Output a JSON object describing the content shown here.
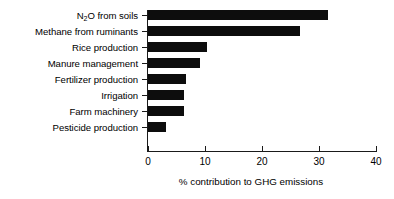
{
  "chart_data": {
    "type": "bar",
    "orientation": "horizontal",
    "title": "",
    "xlabel": "% contribution to GHG emissions",
    "ylabel": "",
    "xlim": [
      0,
      40
    ],
    "xticks": [
      0,
      10,
      20,
      30,
      40
    ],
    "xtick_labels": [
      "0",
      "10",
      "20",
      "30",
      "40"
    ],
    "grid": false,
    "legend": false,
    "bar_color": "#0d0d0d",
    "axis_color": "#1a1a1a",
    "background": "#ffffff",
    "categories": [
      "N₂O from soils",
      "Methane from ruminants",
      "Rice production",
      "Manure management",
      "Fertilizer production",
      "Irrigation",
      "Farm machinery",
      "Pesticide production"
    ],
    "category_parts": [
      {
        "pre": "N",
        "sub": "2",
        "post": "O from soils"
      },
      {
        "pre": "Methane from ruminants",
        "sub": "",
        "post": ""
      },
      {
        "pre": "Rice production",
        "sub": "",
        "post": ""
      },
      {
        "pre": "Manure management",
        "sub": "",
        "post": ""
      },
      {
        "pre": "Fertilizer production",
        "sub": "",
        "post": ""
      },
      {
        "pre": "Irrigation",
        "sub": "",
        "post": ""
      },
      {
        "pre": "Farm machinery",
        "sub": "",
        "post": ""
      },
      {
        "pre": "Pesticide production",
        "sub": "",
        "post": ""
      }
    ],
    "values": [
      31.6,
      26.6,
      10.3,
      9.2,
      6.7,
      6.3,
      6.3,
      3.2
    ]
  }
}
